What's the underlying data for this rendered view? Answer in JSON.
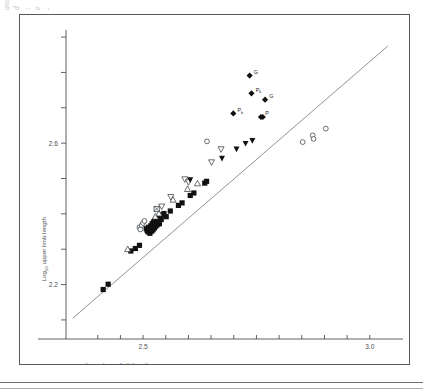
{
  "figure": {
    "margin_note": "of\no\ne\nand\nd\n:\ne\n-",
    "frame_visible": true
  },
  "chart_data": {
    "type": "scatter",
    "title": "",
    "xlabel": "Log10 lower limb length",
    "xlabel_base": "Log",
    "xlabel_sub": "10",
    "xlabel_rest": " lower limb length",
    "ylabel": "Log10 upper limb length",
    "ylabel_base": "Log",
    "ylabel_sub": "10",
    "ylabel_rest": " upper limb length",
    "xlim": [
      2.33,
      3.06
    ],
    "ylim": [
      2.08,
      2.92
    ],
    "xticks": [
      2.4,
      2.45,
      2.5,
      2.55,
      2.6,
      2.65,
      2.7,
      2.75,
      2.8,
      2.85,
      2.9,
      2.95,
      3.0
    ],
    "xtick_labels": [
      "",
      "",
      "2.5",
      "",
      "",
      "",
      "",
      "",
      "",
      "",
      "",
      "",
      "3.0"
    ],
    "yticks": [
      2.1,
      2.2,
      2.3,
      2.4,
      2.5,
      2.6,
      2.7,
      2.8,
      2.9
    ],
    "ytick_labels": [
      "",
      "2.2",
      "",
      "",
      "",
      "2.6",
      "",
      "",
      ""
    ],
    "grid": false,
    "legend": "none",
    "reference_line": {
      "label": "isometry / regression line",
      "x": [
        2.345,
        3.04
      ],
      "y": [
        2.105,
        2.875
      ]
    },
    "series": [
      {
        "name": "filled-square",
        "marker": "filled-square",
        "points": [
          [
            2.412,
            2.186
          ],
          [
            2.423,
            2.201
          ],
          [
            2.473,
            2.295
          ],
          [
            2.483,
            2.302
          ],
          [
            2.492,
            2.311
          ],
          [
            2.507,
            2.358
          ],
          [
            2.509,
            2.353
          ],
          [
            2.511,
            2.349
          ],
          [
            2.512,
            2.362
          ],
          [
            2.514,
            2.356
          ],
          [
            2.515,
            2.345
          ],
          [
            2.517,
            2.366
          ],
          [
            2.518,
            2.359
          ],
          [
            2.519,
            2.351
          ],
          [
            2.52,
            2.372
          ],
          [
            2.521,
            2.363
          ],
          [
            2.522,
            2.355
          ],
          [
            2.523,
            2.377
          ],
          [
            2.524,
            2.368
          ],
          [
            2.525,
            2.36
          ],
          [
            2.526,
            2.381
          ],
          [
            2.527,
            2.373
          ],
          [
            2.528,
            2.365
          ],
          [
            2.529,
            2.385
          ],
          [
            2.53,
            2.376
          ],
          [
            2.531,
            2.369
          ],
          [
            2.533,
            2.389
          ],
          [
            2.534,
            2.38
          ],
          [
            2.536,
            2.372
          ],
          [
            2.538,
            2.393
          ],
          [
            2.54,
            2.384
          ],
          [
            2.542,
            2.397
          ],
          [
            2.546,
            2.401
          ],
          [
            2.551,
            2.392
          ],
          [
            2.56,
            2.408
          ],
          [
            2.578,
            2.424
          ],
          [
            2.586,
            2.431
          ],
          [
            2.604,
            2.452
          ],
          [
            2.612,
            2.459
          ],
          [
            2.636,
            2.487
          ],
          [
            2.64,
            2.492
          ]
        ]
      },
      {
        "name": "open-triangle-up",
        "marker": "open-triangle-up",
        "points": [
          [
            2.466,
            2.3
          ],
          [
            2.527,
            2.392
          ],
          [
            2.535,
            2.401
          ],
          [
            2.566,
            2.44
          ],
          [
            2.598,
            2.47
          ],
          [
            2.62,
            2.486
          ]
        ]
      },
      {
        "name": "open-triangle-down",
        "marker": "open-triangle-down",
        "points": [
          [
            2.541,
            2.421
          ],
          [
            2.561,
            2.448
          ],
          [
            2.592,
            2.498
          ],
          [
            2.651,
            2.546
          ],
          [
            2.672,
            2.583
          ],
          [
            2.6,
            2.49
          ]
        ]
      },
      {
        "name": "filled-triangle-down",
        "marker": "filled-triangle-down",
        "points": [
          [
            2.604,
            2.497
          ],
          [
            2.674,
            2.558
          ],
          [
            2.706,
            2.584
          ],
          [
            2.726,
            2.6
          ],
          [
            2.741,
            2.608
          ]
        ]
      },
      {
        "name": "open-circle",
        "marker": "open-circle",
        "points": [
          [
            2.492,
            2.362
          ],
          [
            2.494,
            2.356
          ],
          [
            2.497,
            2.368
          ],
          [
            2.5,
            2.374
          ],
          [
            2.503,
            2.38
          ],
          [
            2.641,
            2.605
          ],
          [
            2.852,
            2.603
          ],
          [
            2.874,
            2.622
          ],
          [
            2.876,
            2.612
          ],
          [
            2.903,
            2.641
          ]
        ]
      },
      {
        "name": "open-square-x",
        "marker": "open-square-x",
        "points": [
          [
            2.53,
            2.414
          ]
        ]
      },
      {
        "name": "filled-diamond-labeled",
        "marker": "filled-diamond",
        "points": [
          {
            "x": 2.699,
            "y": 2.684,
            "label": "P",
            "sublabel": "b"
          },
          {
            "x": 2.739,
            "y": 2.741,
            "label": "P",
            "sublabel": "b"
          },
          {
            "x": 2.76,
            "y": 2.674,
            "label": "P",
            "sublabel": ""
          },
          {
            "x": 2.764,
            "y": 2.674,
            "label": "",
            "sublabel": ""
          },
          {
            "x": 2.769,
            "y": 2.723,
            "label": "G",
            "sublabel": ""
          },
          {
            "x": 2.735,
            "y": 2.791,
            "label": "G",
            "sublabel": ""
          }
        ]
      }
    ]
  }
}
